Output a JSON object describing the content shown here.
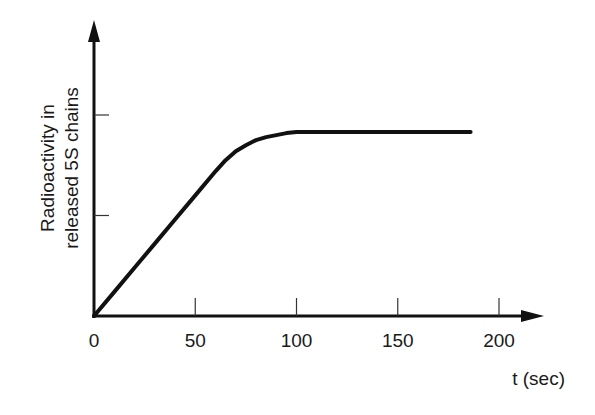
{
  "chart_data": {
    "type": "line",
    "title": "",
    "xlabel": "t (sec)",
    "ylabel": [
      "Radioactivity in",
      "released 5S chains"
    ],
    "x_ticks": [
      0,
      50,
      100,
      150,
      200
    ],
    "x_tick_labels": [
      "0",
      "50",
      "100",
      "150",
      "200"
    ],
    "y_ticks": [
      1,
      2
    ],
    "y_tick_labels": [
      "",
      ""
    ],
    "xlim": [
      0,
      220
    ],
    "ylim": [
      0,
      2.6
    ],
    "grid": false,
    "legend": null,
    "series": [
      {
        "name": "Radioactivity in released 5S chains",
        "x": [
          0,
          10,
          20,
          30,
          40,
          50,
          60,
          65,
          70,
          75,
          80,
          85,
          90,
          95,
          100,
          120,
          140,
          160,
          180,
          186
        ],
        "values": [
          0,
          0.24,
          0.48,
          0.72,
          0.96,
          1.2,
          1.44,
          1.55,
          1.64,
          1.7,
          1.75,
          1.78,
          1.8,
          1.82,
          1.83,
          1.83,
          1.83,
          1.83,
          1.83,
          1.83
        ]
      }
    ],
    "color": "#111111"
  }
}
